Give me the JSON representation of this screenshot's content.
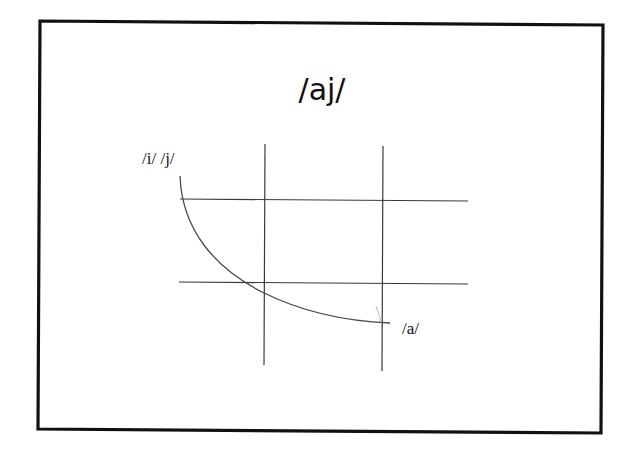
{
  "slide": {
    "title": "/aj/",
    "labels": {
      "start": "/i/ /j/",
      "end": "/a/"
    },
    "diagram": {
      "description": "Vowel space grid with trajectory from /i/ /j/ (high front) curving to /a/ (low)",
      "grid": {
        "vertical_lines": 2,
        "horizontal_lines": 2
      },
      "trajectory": {
        "from": "/i/ /j/",
        "to": "/a/"
      }
    },
    "colors": {
      "background": "#ffffff",
      "ink": "#111111",
      "grid": "#3a3a3a",
      "curve": "#4a4a4a"
    }
  }
}
